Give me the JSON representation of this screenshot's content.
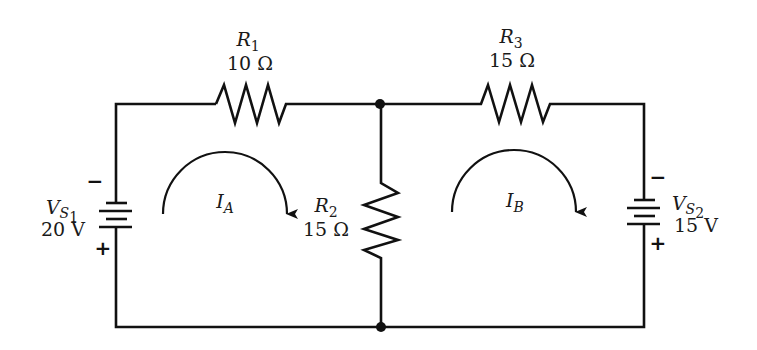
{
  "colors": {
    "line": "#111111",
    "text": "#1a1a1a",
    "background": "#ffffff"
  },
  "resistors": [
    {
      "id": "R1",
      "symbol": "R",
      "index": "1",
      "value": "10 Ω"
    },
    {
      "id": "R2",
      "symbol": "R",
      "index": "2",
      "value": "15 Ω"
    },
    {
      "id": "R3",
      "symbol": "R",
      "index": "3",
      "value": "15 Ω"
    }
  ],
  "sources": [
    {
      "id": "VS1",
      "symbol": "V",
      "sub": "S",
      "index": "1",
      "value": "20 V",
      "top_sign": "−",
      "bottom_sign": "+"
    },
    {
      "id": "VS2",
      "symbol": "V",
      "sub": "S",
      "index": "2",
      "value": "15 V",
      "top_sign": "−",
      "bottom_sign": "+"
    }
  ],
  "loops": [
    {
      "id": "IA",
      "symbol": "I",
      "sub": "A",
      "direction": "clockwise"
    },
    {
      "id": "IB",
      "symbol": "I",
      "sub": "B",
      "direction": "clockwise"
    }
  ]
}
